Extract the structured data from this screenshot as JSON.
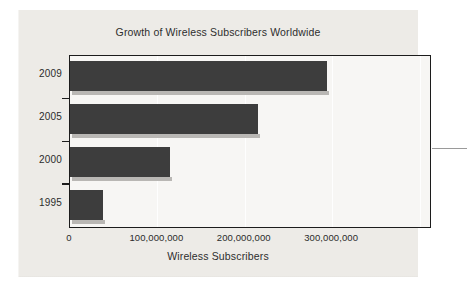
{
  "figure": {
    "title": "Growth of Wireless Subscribers Worldwide",
    "x_axis_title": "Wireless Subscribers",
    "accent_color": "#3d3d3d",
    "panel_color": "#edebe7",
    "frame_color": "#1c1c1c"
  },
  "chart_data": {
    "type": "bar",
    "orientation": "horizontal",
    "title": "Growth of Wireless Subscribers Worldwide",
    "xlabel": "Wireless Subscribers",
    "ylabel": "",
    "categories": [
      "2009",
      "2005",
      "2000",
      "1995"
    ],
    "values": [
      294000000,
      215000000,
      115000000,
      38000000
    ],
    "xlim": [
      0,
      412000000
    ],
    "xticks": [
      0,
      100000000,
      200000000,
      300000000
    ],
    "xtick_labels": [
      "0",
      "100,000,000",
      "200,000,000",
      "300,000,000"
    ],
    "grid": true,
    "grid_axis": "x",
    "legend": false,
    "series": [
      {
        "name": "Wireless Subscribers",
        "color": "#3d3d3d",
        "values": [
          294000000,
          215000000,
          115000000,
          38000000
        ]
      }
    ]
  }
}
